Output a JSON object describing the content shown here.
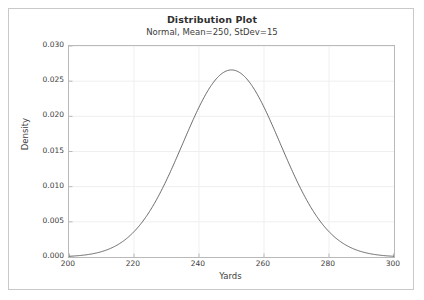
{
  "chart_data": {
    "type": "line",
    "title": "Distribution Plot",
    "subtitle": "Normal, Mean=250, StDev=15",
    "xlabel": "Yards",
    "ylabel": "Density",
    "distribution": "Normal",
    "mean": 250,
    "stdev": 15,
    "xlim": [
      200,
      300
    ],
    "ylim": [
      0,
      0.03
    ],
    "xticks": [
      200,
      220,
      240,
      260,
      280,
      300
    ],
    "xtick_labels": [
      "200",
      "220",
      "240",
      "260",
      "280",
      "300"
    ],
    "yticks": [
      0.0,
      0.005,
      0.01,
      0.015,
      0.02,
      0.025,
      0.03
    ],
    "ytick_labels": [
      "0.000",
      "0.005",
      "0.010",
      "0.015",
      "0.020",
      "0.025",
      "0.030"
    ],
    "grid": true,
    "legend": "none",
    "peak_value": 0.0266,
    "peak_x": 250,
    "line_color": "#5a5a5a",
    "grid_color": "#efefef",
    "frame_color": "#b9b9b9",
    "background_color": "#ffffff",
    "x": [
      200,
      205,
      210,
      215,
      220,
      225,
      230,
      235,
      240,
      245,
      250,
      255,
      260,
      265,
      270,
      275,
      280,
      285,
      290,
      295,
      300
    ],
    "values": [
      9.1e-05,
      0.000308,
      0.000895,
      0.002218,
      0.004698,
      0.008525,
      0.013262,
      0.017662,
      0.020179,
      0.019652,
      0.01644,
      0.01179,
      0.007249,
      0.003823,
      0.00173,
      0.000671,
      0.000223,
      6.4e-05,
      1.6e-05,
      3e-06,
      1e-06
    ]
  }
}
